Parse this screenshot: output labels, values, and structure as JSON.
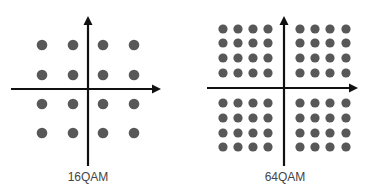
{
  "diagrams": [
    {
      "id": "16qam",
      "label": "16QAM",
      "points_per_axis": 4,
      "total_points": 16,
      "origin": [
        88,
        89
      ],
      "h_axis": {
        "x1": 11,
        "x2": 161,
        "y": 89
      },
      "v_axis": {
        "x": 88,
        "y1": 16,
        "y2": 166
      },
      "cols": [
        42,
        73,
        103,
        134
      ],
      "rows": [
        45,
        75,
        104,
        133
      ],
      "dot_radius": 5.3,
      "label_pos": [
        88,
        181
      ]
    },
    {
      "id": "64qam",
      "label": "64QAM",
      "points_per_axis": 8,
      "total_points": 64,
      "origin": [
        284,
        88
      ],
      "h_axis": {
        "x1": 207,
        "x2": 358,
        "y": 88
      },
      "v_axis": {
        "x": 284,
        "y1": 16,
        "y2": 166
      },
      "cols": [
        223,
        238,
        253,
        268,
        300,
        315,
        330,
        346
      ],
      "rows": [
        29,
        43,
        58,
        73,
        103,
        118,
        133,
        147
      ],
      "dot_radius": 4.6,
      "label_pos": [
        285,
        181
      ]
    }
  ],
  "colors": {
    "dot": "#585858",
    "axis": "#111111",
    "label": "#444444",
    "background": "#ffffff"
  }
}
